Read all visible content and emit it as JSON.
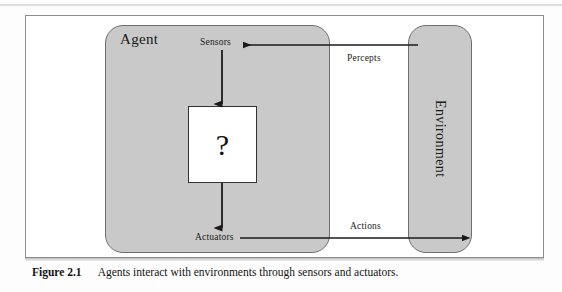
{
  "figure": {
    "number": "Figure 2.1",
    "caption": "Agents interact with environments through sensors and actuators.",
    "agent_label": "Agent",
    "environment_label": "Environment",
    "question_mark": "?",
    "nodes": {
      "sensors": "Sensors",
      "actuators": "Actuators"
    },
    "edges": {
      "percepts": "Percepts",
      "actions": "Actions"
    },
    "colors": {
      "box_fill": "#c9c9c9",
      "box_stroke": "#6f6f6f",
      "frame_stroke": "#8d8d8d",
      "arrow": "#1a1a1a",
      "question_box_fill": "#ffffff",
      "question_box_stroke": "#333333",
      "text": "#1b1b1b"
    }
  }
}
